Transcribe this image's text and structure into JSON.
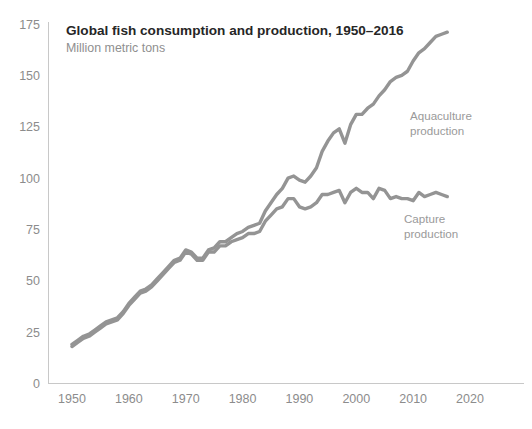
{
  "chart_data": {
    "type": "line",
    "title": "Global fish consumption and production, 1950–2016",
    "subtitle": "Million metric tons",
    "xlabel": "",
    "ylabel": "",
    "xlim": [
      1947,
      2023
    ],
    "ylim": [
      0,
      175
    ],
    "grid": false,
    "legend_position": "inline-annotation",
    "x_ticks": [
      "1950",
      "1960",
      "1970",
      "1980",
      "1990",
      "2000",
      "2010",
      "2020"
    ],
    "x_tick_values": [
      1950,
      1960,
      1970,
      1980,
      1990,
      2000,
      2010,
      2020
    ],
    "y_ticks": [
      "0",
      "25",
      "50",
      "75",
      "100",
      "125",
      "150",
      "175"
    ],
    "y_tick_values": [
      0,
      25,
      50,
      75,
      100,
      125,
      150,
      175
    ],
    "line_color": "#949494",
    "x": [
      1950,
      1951,
      1952,
      1953,
      1954,
      1955,
      1956,
      1957,
      1958,
      1959,
      1960,
      1961,
      1962,
      1963,
      1964,
      1965,
      1966,
      1967,
      1968,
      1969,
      1970,
      1971,
      1972,
      1973,
      1974,
      1975,
      1976,
      1977,
      1978,
      1979,
      1980,
      1981,
      1982,
      1983,
      1984,
      1985,
      1986,
      1987,
      1988,
      1989,
      1990,
      1991,
      1992,
      1993,
      1994,
      1995,
      1996,
      1997,
      1998,
      1999,
      2000,
      2001,
      2002,
      2003,
      2004,
      2005,
      2006,
      2007,
      2008,
      2009,
      2010,
      2011,
      2012,
      2013,
      2014,
      2015,
      2016
    ],
    "series": [
      {
        "name": "Aquaculture production",
        "label": "Aquaculture production",
        "values": [
          19,
          21,
          23,
          24,
          26,
          28,
          30,
          31,
          32,
          35,
          39,
          42,
          45,
          46,
          48,
          51,
          54,
          57,
          60,
          61,
          65,
          64,
          61,
          61,
          65,
          66,
          69,
          69,
          71,
          73,
          74,
          76,
          77,
          78,
          84,
          88,
          92,
          95,
          100,
          101,
          99,
          98,
          101,
          105,
          113,
          118,
          122,
          124,
          117,
          126,
          131,
          131,
          134,
          136,
          140,
          143,
          147,
          149,
          150,
          152,
          157,
          161,
          163,
          166,
          169,
          170,
          171
        ]
      },
      {
        "name": "Capture production",
        "label": "Capture production",
        "values": [
          18,
          20,
          22,
          23,
          25,
          27,
          29,
          30,
          31,
          34,
          38,
          41,
          44,
          45,
          47,
          50,
          53,
          56,
          59,
          60,
          64,
          63,
          60,
          60,
          64,
          64,
          67,
          67,
          69,
          70,
          71,
          73,
          73,
          74,
          79,
          82,
          85,
          86,
          90,
          90,
          86,
          85,
          86,
          88,
          92,
          92,
          93,
          94,
          88,
          93,
          95,
          93,
          93,
          90,
          95,
          94,
          90,
          91,
          90,
          90,
          89,
          93,
          91,
          92,
          93,
          92,
          91
        ]
      }
    ],
    "annotations": [
      {
        "text": "Aquaculture production",
        "series": "Aquaculture production"
      },
      {
        "text": "Capture production",
        "series": "Capture production"
      }
    ]
  },
  "labels": {
    "aquaculture_line1": "Aquaculture",
    "aquaculture_line2": "production",
    "capture_line1": "Capture",
    "capture_line2": "production"
  }
}
